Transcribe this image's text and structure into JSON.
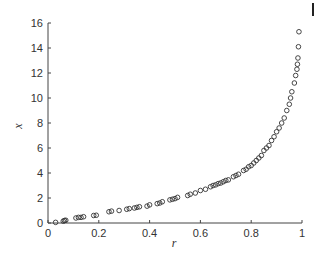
{
  "chart_data": {
    "type": "scatter",
    "title": "",
    "xlabel": "r",
    "ylabel": "x",
    "xlim": [
      0,
      1
    ],
    "ylim": [
      0,
      16
    ],
    "xticks": [
      0,
      0.2,
      0.4,
      0.6,
      0.8,
      1
    ],
    "xtick_labels": [
      "0",
      "0.2",
      "0.4",
      "0.6",
      "0.8",
      "1"
    ],
    "yticks": [
      0,
      2,
      4,
      6,
      8,
      10,
      12,
      14,
      16
    ],
    "ytick_labels": [
      "0",
      "2",
      "4",
      "6",
      "8",
      "10",
      "12",
      "14",
      "16"
    ],
    "grid": false,
    "legend": null,
    "marker": "open-circle",
    "marker_color": "#333333",
    "series": [
      {
        "name": "data",
        "points": [
          [
            0.03,
            0.05
          ],
          [
            0.06,
            0.15
          ],
          [
            0.065,
            0.2
          ],
          [
            0.07,
            0.22
          ],
          [
            0.11,
            0.4
          ],
          [
            0.12,
            0.45
          ],
          [
            0.13,
            0.45
          ],
          [
            0.14,
            0.5
          ],
          [
            0.18,
            0.6
          ],
          [
            0.19,
            0.62
          ],
          [
            0.24,
            0.9
          ],
          [
            0.25,
            0.95
          ],
          [
            0.28,
            1.0
          ],
          [
            0.31,
            1.1
          ],
          [
            0.32,
            1.15
          ],
          [
            0.34,
            1.2
          ],
          [
            0.35,
            1.25
          ],
          [
            0.36,
            1.3
          ],
          [
            0.39,
            1.35
          ],
          [
            0.4,
            1.45
          ],
          [
            0.43,
            1.55
          ],
          [
            0.44,
            1.6
          ],
          [
            0.45,
            1.7
          ],
          [
            0.48,
            1.85
          ],
          [
            0.49,
            1.9
          ],
          [
            0.5,
            1.95
          ],
          [
            0.51,
            2.05
          ],
          [
            0.55,
            2.2
          ],
          [
            0.56,
            2.3
          ],
          [
            0.58,
            2.4
          ],
          [
            0.6,
            2.6
          ],
          [
            0.62,
            2.7
          ],
          [
            0.64,
            2.9
          ],
          [
            0.65,
            3.0
          ],
          [
            0.66,
            3.05
          ],
          [
            0.67,
            3.15
          ],
          [
            0.68,
            3.2
          ],
          [
            0.69,
            3.3
          ],
          [
            0.7,
            3.4
          ],
          [
            0.71,
            3.45
          ],
          [
            0.73,
            3.7
          ],
          [
            0.74,
            3.8
          ],
          [
            0.75,
            3.9
          ],
          [
            0.77,
            4.2
          ],
          [
            0.78,
            4.3
          ],
          [
            0.79,
            4.5
          ],
          [
            0.8,
            4.6
          ],
          [
            0.81,
            4.8
          ],
          [
            0.82,
            5.0
          ],
          [
            0.83,
            5.2
          ],
          [
            0.84,
            5.4
          ],
          [
            0.85,
            5.8
          ],
          [
            0.86,
            6.0
          ],
          [
            0.87,
            6.2
          ],
          [
            0.88,
            6.6
          ],
          [
            0.89,
            6.9
          ],
          [
            0.9,
            7.3
          ],
          [
            0.91,
            7.6
          ],
          [
            0.92,
            8.0
          ],
          [
            0.93,
            8.4
          ],
          [
            0.94,
            9.0
          ],
          [
            0.95,
            9.5
          ],
          [
            0.955,
            10.0
          ],
          [
            0.96,
            10.5
          ],
          [
            0.97,
            11.2
          ],
          [
            0.975,
            11.8
          ],
          [
            0.98,
            12.3
          ],
          [
            0.982,
            12.7
          ],
          [
            0.984,
            13.2
          ],
          [
            0.986,
            14.1
          ],
          [
            0.988,
            15.3
          ]
        ]
      }
    ]
  },
  "layout": {
    "plot_left": 48,
    "plot_right": 302,
    "plot_top": 23,
    "plot_bottom": 223,
    "axis_color": "#444444"
  }
}
